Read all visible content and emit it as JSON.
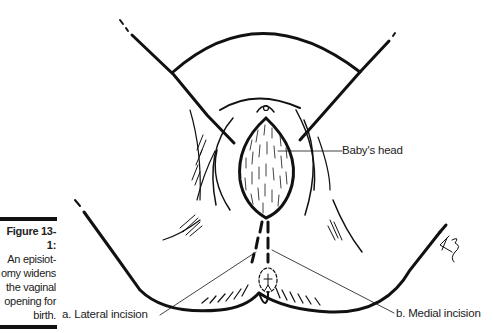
{
  "caption": {
    "figure_number": "Figure 13-1:",
    "lines": [
      "An episiot-",
      "omy widens",
      "the vaginal",
      "opening for",
      "birth."
    ]
  },
  "labels": {
    "babys_head": "Baby's head",
    "lateral_incision": "a. Lateral incision",
    "medial_incision": "b. Medial incision"
  },
  "signature": "KB",
  "colors": {
    "ink": "#111111",
    "text": "#222222",
    "background": "#ffffff"
  }
}
